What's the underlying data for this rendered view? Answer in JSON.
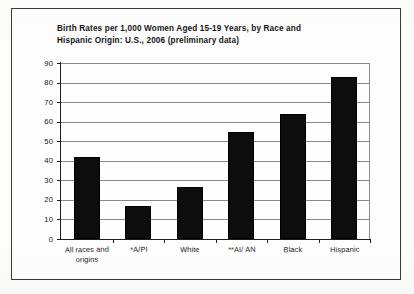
{
  "chart_data": {
    "type": "bar",
    "title": "Birth Rates per 1,000 Women Aged 15-19 Years, by Race and\nHispanic Origin: U.S., 2006 (preliminary data)",
    "categories": [
      "All races and\norigins",
      "*A/PI",
      "White",
      "**AI/ AN",
      "Black",
      "Hispanic"
    ],
    "values": [
      41.9,
      16.7,
      26.6,
      54.7,
      63.7,
      83.0
    ],
    "xlabel": "",
    "ylabel": "",
    "ylim": [
      0,
      90
    ],
    "ytick_step": 10,
    "yticks": [
      "0",
      "10",
      "20",
      "30",
      "40",
      "50",
      "60",
      "70",
      "80",
      "90"
    ],
    "grid": true,
    "legend": "none",
    "bar_color": "#0d0d0d",
    "gridline_color": "#8a8a8a",
    "axis_color": "#1f1f1f"
  },
  "figure": {
    "frame_border_color": "#3a3a3a",
    "background": "#fefefe"
  }
}
